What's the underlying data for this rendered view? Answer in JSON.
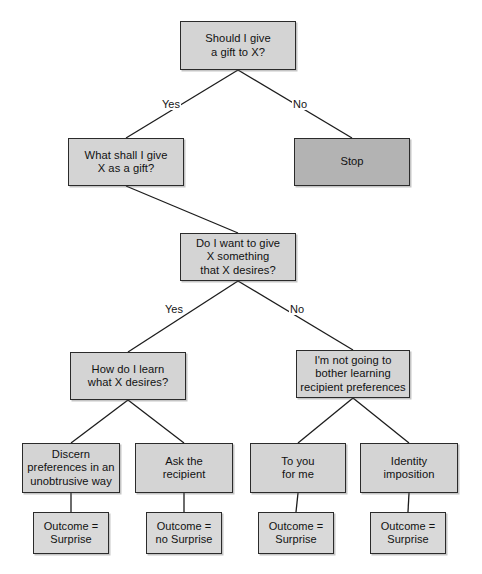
{
  "diagram": {
    "type": "decision-tree-flowchart",
    "colors": {
      "node_fill": "#d4d4d4",
      "terminal_fill": "#b3b3b3",
      "outcome_fill": "#d9d9d9",
      "border": "#2b2b2b",
      "background": "#ffffff",
      "text": "#111111"
    },
    "nodes": [
      {
        "id": "root",
        "label": "Should I give\na gift to X?",
        "x": 180,
        "y": 21,
        "w": 116,
        "h": 49,
        "style": "question"
      },
      {
        "id": "what-gift",
        "label": "What shall I give\nX as a gift?",
        "x": 68,
        "y": 138,
        "w": 116,
        "h": 48,
        "style": "question"
      },
      {
        "id": "stop",
        "label": "Stop",
        "x": 294,
        "y": 138,
        "w": 116,
        "h": 48,
        "style": "terminal"
      },
      {
        "id": "desires",
        "label": "Do I want to give\nX something\nthat X desires?",
        "x": 180,
        "y": 233,
        "w": 116,
        "h": 48,
        "style": "question"
      },
      {
        "id": "how-learn",
        "label": "How do I learn\nwhat X desires?",
        "x": 70,
        "y": 352,
        "w": 116,
        "h": 48,
        "style": "question"
      },
      {
        "id": "not-bother",
        "label": "I'm not going to\nbother learning\nrecipient preferences",
        "x": 296,
        "y": 350,
        "w": 114,
        "h": 48,
        "style": "question"
      },
      {
        "id": "discern",
        "label": "Discern\npreferences in an\nunobtrusive way",
        "x": 22,
        "y": 443,
        "w": 98,
        "h": 50,
        "style": "question"
      },
      {
        "id": "ask",
        "label": "Ask the\nrecipient",
        "x": 135,
        "y": 443,
        "w": 98,
        "h": 50,
        "style": "question"
      },
      {
        "id": "to-you",
        "label": "To you\nfor me",
        "x": 250,
        "y": 443,
        "w": 96,
        "h": 50,
        "style": "question"
      },
      {
        "id": "identity",
        "label": "Identity\nimposition",
        "x": 360,
        "y": 443,
        "w": 98,
        "h": 50,
        "style": "question"
      },
      {
        "id": "out-1",
        "label": "Outcome =\nSurprise",
        "x": 33,
        "y": 512,
        "w": 76,
        "h": 42,
        "style": "outcome"
      },
      {
        "id": "out-2",
        "label": "Outcome =\nno Surprise",
        "x": 146,
        "y": 512,
        "w": 76,
        "h": 42,
        "style": "outcome"
      },
      {
        "id": "out-3",
        "label": "Outcome =\nSurprise",
        "x": 258,
        "y": 512,
        "w": 76,
        "h": 42,
        "style": "outcome"
      },
      {
        "id": "out-4",
        "label": "Outcome =\nSurprise",
        "x": 370,
        "y": 512,
        "w": 76,
        "h": 42,
        "style": "outcome"
      }
    ],
    "edges": [
      {
        "id": "e-root-yes",
        "from": "root",
        "to": "what-gift",
        "x1": 238,
        "y1": 70,
        "x2": 126,
        "y2": 138,
        "label": "Yes"
      },
      {
        "id": "e-root-no",
        "from": "root",
        "to": "stop",
        "x1": 238,
        "y1": 70,
        "x2": 352,
        "y2": 138,
        "label": "No"
      },
      {
        "id": "e-what-des",
        "from": "what-gift",
        "to": "desires",
        "x1": 126,
        "y1": 186,
        "x2": 238,
        "y2": 233,
        "label": ""
      },
      {
        "id": "e-des-yes",
        "from": "desires",
        "to": "how-learn",
        "x1": 238,
        "y1": 281,
        "x2": 128,
        "y2": 352,
        "label": "Yes"
      },
      {
        "id": "e-des-no",
        "from": "desires",
        "to": "not-bother",
        "x1": 238,
        "y1": 281,
        "x2": 353,
        "y2": 350,
        "label": "No"
      },
      {
        "id": "e-how-disc",
        "from": "how-learn",
        "to": "discern",
        "x1": 128,
        "y1": 400,
        "x2": 71,
        "y2": 443,
        "label": ""
      },
      {
        "id": "e-how-ask",
        "from": "how-learn",
        "to": "ask",
        "x1": 128,
        "y1": 400,
        "x2": 184,
        "y2": 443,
        "label": ""
      },
      {
        "id": "e-not-toyou",
        "from": "not-bother",
        "to": "to-you",
        "x1": 353,
        "y1": 398,
        "x2": 298,
        "y2": 443,
        "label": ""
      },
      {
        "id": "e-not-ident",
        "from": "not-bother",
        "to": "identity",
        "x1": 353,
        "y1": 398,
        "x2": 409,
        "y2": 443,
        "label": ""
      },
      {
        "id": "e-disc-o1",
        "from": "discern",
        "to": "out-1",
        "x1": 71,
        "y1": 493,
        "x2": 71,
        "y2": 512,
        "label": ""
      },
      {
        "id": "e-ask-o2",
        "from": "ask",
        "to": "out-2",
        "x1": 184,
        "y1": 493,
        "x2": 184,
        "y2": 512,
        "label": ""
      },
      {
        "id": "e-toyou-o3",
        "from": "to-you",
        "to": "out-3",
        "x1": 298,
        "y1": 493,
        "x2": 296,
        "y2": 512,
        "label": ""
      },
      {
        "id": "e-ident-o4",
        "from": "identity",
        "to": "out-4",
        "x1": 409,
        "y1": 493,
        "x2": 408,
        "y2": 512,
        "label": ""
      }
    ],
    "edge_labels": [
      {
        "id": "lbl-yes-1",
        "text": "Yes",
        "x": 161,
        "y": 98
      },
      {
        "id": "lbl-no-1",
        "text": "No",
        "x": 292,
        "y": 98
      },
      {
        "id": "lbl-yes-2",
        "text": "Yes",
        "x": 164,
        "y": 303
      },
      {
        "id": "lbl-no-2",
        "text": "No",
        "x": 289,
        "y": 303
      }
    ]
  }
}
